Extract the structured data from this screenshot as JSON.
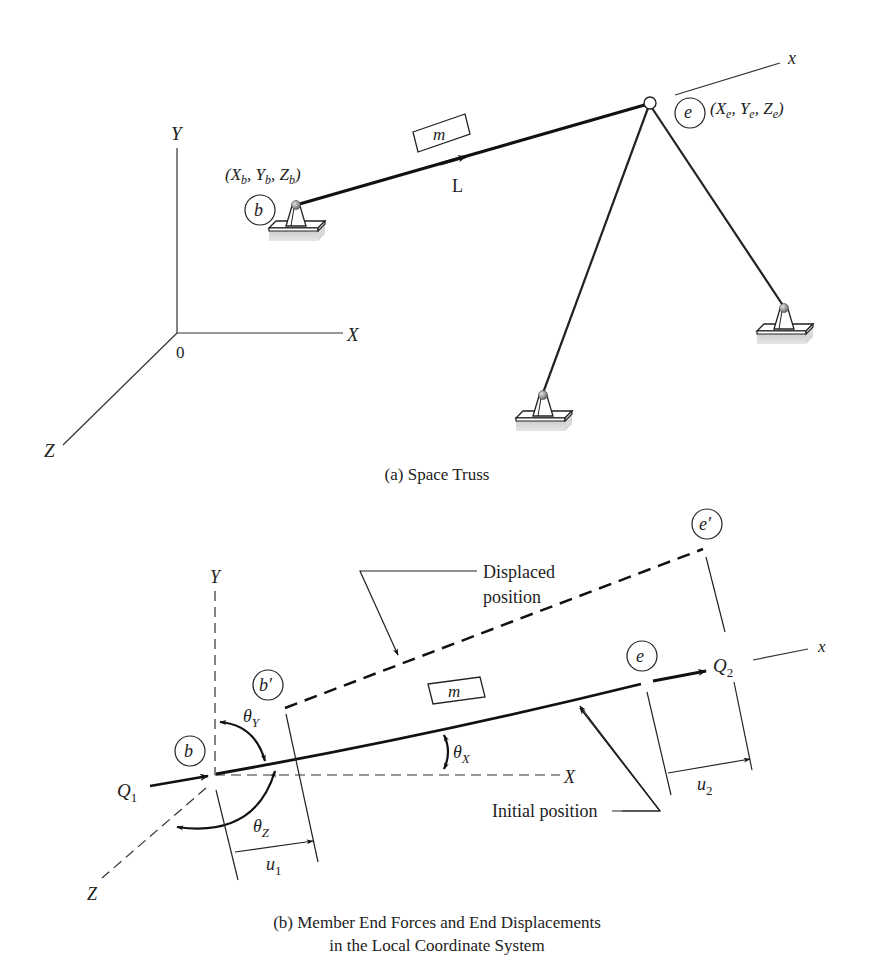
{
  "figure_a": {
    "caption": "(a) Space Truss",
    "axes": {
      "x": "X",
      "y": "Y",
      "z": "Z",
      "origin": "0"
    },
    "node_b": {
      "label": "b",
      "coords_open": "(X",
      "coords_b_sub": "b",
      "coords_sep1": ", Y",
      "coords_sep2": ", Z",
      "coords_close": ")"
    },
    "node_e": {
      "label": "e",
      "coords_open": "(X",
      "coords_e_sub": "e",
      "coords_sep1": ", Y",
      "coords_sep2": ", Z",
      "coords_close": ")"
    },
    "member": {
      "label": "m",
      "length_label": "L"
    },
    "local_axis": "x"
  },
  "figure_b": {
    "caption_line1": "(b) Member End Forces and End Displacements",
    "caption_line2": "in the Local Coordinate System",
    "axes": {
      "x": "X",
      "y": "Y",
      "z": "Z",
      "local_x": "x"
    },
    "nodes": {
      "b": "b",
      "b_prime": "b′",
      "e": "e",
      "e_prime": "e′"
    },
    "member": {
      "label": "m"
    },
    "forces": {
      "q1_main": "Q",
      "q1_sub": "1",
      "q2_main": "Q",
      "q2_sub": "2"
    },
    "angles": {
      "theta_x_main": "θ",
      "theta_x_sub": "X",
      "theta_y_main": "θ",
      "theta_y_sub": "Y",
      "theta_z_main": "θ",
      "theta_z_sub": "Z"
    },
    "displacements": {
      "u1_main": "u",
      "u1_sub": "1",
      "u2_main": "u",
      "u2_sub": "2"
    },
    "annotations": {
      "displaced_line1": "Displaced",
      "displaced_line2": "position",
      "initial": "Initial position"
    }
  }
}
